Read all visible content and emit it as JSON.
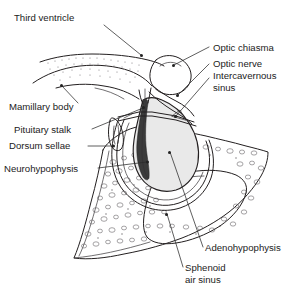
{
  "figure": {
    "background_color": "#ffffff",
    "ink_color": "#231f20",
    "gland_fill_color": "#e9e9e9",
    "neurohypophysis_color": "#3b3b3b",
    "bone_stipple_color": "#5c585c"
  },
  "labels": [
    {
      "id": "third-ventricle",
      "text": "Third ventricle",
      "text_x": 14,
      "text_y": 21,
      "anchor": "start",
      "leader": "M 104,25 L 141,55",
      "dot_x": 141.5,
      "dot_y": 55.5
    },
    {
      "id": "mamillary-body",
      "text": "Mamillary body",
      "text_x": 9,
      "text_y": 110,
      "anchor": "start",
      "leader": "M 78,103 L 62,86",
      "dot_x": 61.5,
      "dot_y": 85.5
    },
    {
      "id": "pituitary-stalk",
      "text": "Pituitary stalk",
      "text_x": 14,
      "text_y": 133,
      "anchor": "start",
      "leader": "M 92,129 L 143,108",
      "dot_x": 143.5,
      "dot_y": 107.5
    },
    {
      "id": "dorsum-sellae",
      "text": "Dorsum sellae",
      "text_x": 9,
      "text_y": 149,
      "anchor": "start",
      "leader": "M 88,146 L 113,146",
      "dot_x": 113.5,
      "dot_y": 146
    },
    {
      "id": "neurohypophysis",
      "text": "Neurohypophysis",
      "text_x": 4,
      "text_y": 172,
      "anchor": "start",
      "leader": "M 98,168 L 147,162",
      "dot_x": 147.5,
      "dot_y": 162
    },
    {
      "id": "optic-chiasma",
      "text": "Optic chiasma",
      "text_x": 213,
      "text_y": 51,
      "anchor": "start",
      "leader": "M 209,47 L 174,65",
      "dot_x": 173.5,
      "dot_y": 65.5
    },
    {
      "id": "optic-nerve",
      "text": "Optic nerve",
      "text_x": 213,
      "text_y": 67,
      "anchor": "start",
      "leader": "M 209,64 L 178,95",
      "dot_x": 177.5,
      "dot_y": 95.5
    },
    {
      "id": "intercavernous-sinus-line1",
      "text": "Intercavernous",
      "text_x": 213,
      "text_y": 79,
      "anchor": "start",
      "leader": "M 209,78 L 176,116",
      "dot_x": 175.5,
      "dot_y": 116.5
    },
    {
      "id": "intercavernous-sinus-line2",
      "text": "sinus",
      "text_x": 213,
      "text_y": 91,
      "anchor": "start",
      "leader": "",
      "dot_x": null,
      "dot_y": null
    },
    {
      "id": "adenohypophysis",
      "text": "Adenohypophysis",
      "text_x": 205,
      "text_y": 251,
      "anchor": "start",
      "leader": "M 203,247 L 170,152",
      "dot_x": 169.5,
      "dot_y": 152.5
    },
    {
      "id": "sphenoid-air-sinus-line1",
      "text": "Sphenoid",
      "text_x": 185,
      "text_y": 271,
      "anchor": "start",
      "leader": "M 183,267 L 167,214",
      "dot_x": 166.5,
      "dot_y": 214.5
    },
    {
      "id": "sphenoid-air-sinus-line2",
      "text": "air sinus",
      "text_x": 185,
      "text_y": 283,
      "anchor": "start",
      "leader": "",
      "dot_x": null,
      "dot_y": null
    }
  ],
  "structures": [
    {
      "id": "brain-base-contour",
      "name": "Base of brain / hypothalamus outline"
    },
    {
      "id": "third-ventricle-floor",
      "name": "Floor of third ventricle (stippled)"
    },
    {
      "id": "optic-chiasma-body",
      "name": "Optic chiasma"
    },
    {
      "id": "optic-nerve-body",
      "name": "Optic nerve"
    },
    {
      "id": "pituitary-gland",
      "name": "Pituitary gland (hypophysis)"
    },
    {
      "id": "neurohypophysis-body",
      "name": "Neurohypophysis (posterior lobe)"
    },
    {
      "id": "adenohypophysis-body",
      "name": "Adenohypophysis (anterior lobe)"
    },
    {
      "id": "diaphragma-sellae",
      "name": "Diaphragma sellae / intercavernous sinus"
    },
    {
      "id": "dorsum-sellae-body",
      "name": "Dorsum sellae"
    },
    {
      "id": "sphenoid-bone",
      "name": "Sphenoid bone (cancellous)"
    },
    {
      "id": "sphenoid-sinus-cavity",
      "name": "Sphenoid air sinus"
    }
  ]
}
